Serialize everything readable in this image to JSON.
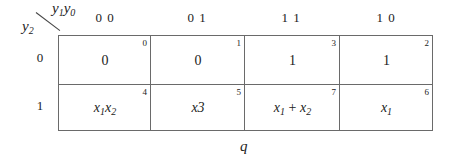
{
  "corner": {
    "col_var_main": "y",
    "col_var_sub1": "1",
    "col_var_main2": "y",
    "col_var_sub0": "0",
    "row_var_main": "y",
    "row_var_sub": "2"
  },
  "columns": [
    "0 0",
    "0 1",
    "1 1",
    "1 0"
  ],
  "rows": [
    "0",
    "1"
  ],
  "cells": {
    "r0": [
      {
        "index": "0",
        "value": "0"
      },
      {
        "index": "1",
        "value": "0"
      },
      {
        "index": "3",
        "value": "1"
      },
      {
        "index": "2",
        "value": "1"
      }
    ],
    "r1": [
      {
        "index": "4",
        "v1": "x",
        "s1": "1",
        "v2": "x",
        "s2": "2"
      },
      {
        "index": "5",
        "value": "x3"
      },
      {
        "index": "7",
        "v1": "x",
        "s1": "1",
        "op": " + ",
        "v2": "x",
        "s2": "2"
      },
      {
        "index": "6",
        "v1": "x",
        "s1": "1"
      }
    ]
  },
  "output_label": "q",
  "colors": {
    "grid": "#6a6a6a",
    "text": "#222222"
  }
}
